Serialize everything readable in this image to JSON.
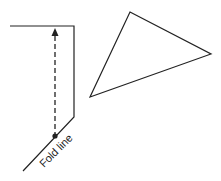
{
  "diagram": {
    "label_fold_line": "Fold line",
    "colors": {
      "stroke": "#222222",
      "background": "#ffffff"
    },
    "paper_shape": {
      "points": [
        [
          10,
          26
        ],
        [
          74,
          26
        ],
        [
          74,
          117
        ],
        [
          23,
          171
        ]
      ]
    },
    "fold_arrow": {
      "x": 55,
      "y_top": 28,
      "y_bottom": 136,
      "style": "dashed",
      "head": "up",
      "tail": "dot"
    },
    "triangle": {
      "points": [
        [
          130,
          12
        ],
        [
          211,
          54
        ],
        [
          90,
          97
        ]
      ]
    }
  }
}
